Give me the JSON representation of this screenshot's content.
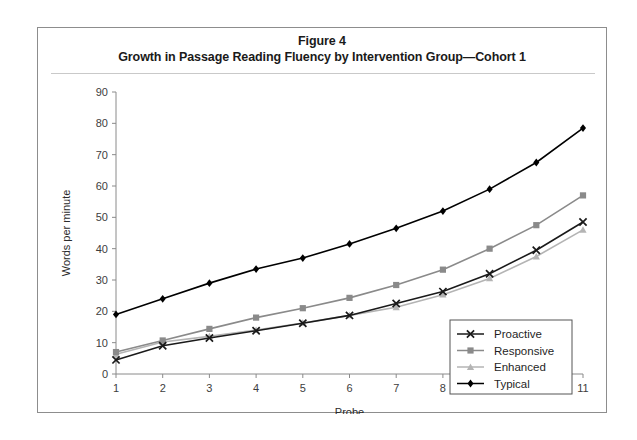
{
  "figure": {
    "number_label": "Figure 4",
    "title": "Growth in Passage Reading Fluency by Intervention Group—Cohort 1"
  },
  "chart_data": {
    "type": "line",
    "title": "Growth in Passage Reading Fluency by Intervention Group—Cohort 1",
    "xlabel": "Probe",
    "ylabel": "Words per minute",
    "x": [
      1,
      2,
      3,
      4,
      5,
      6,
      7,
      8,
      9,
      10,
      11
    ],
    "categories": [
      "1",
      "2",
      "3",
      "4",
      "5",
      "6",
      "7",
      "8",
      "9",
      "10",
      "11"
    ],
    "xlim": [
      1,
      11
    ],
    "ylim": [
      0,
      90
    ],
    "yticks": [
      0,
      10,
      20,
      30,
      40,
      50,
      60,
      70,
      80,
      90
    ],
    "ytick_labels": [
      "0",
      "10",
      "20",
      "30",
      "40",
      "50",
      "60",
      "70",
      "80",
      "90"
    ],
    "grid": false,
    "legend_position": "lower-right-inside",
    "series": [
      {
        "name": "Proactive",
        "marker": "x",
        "color": "#1a1a1a",
        "values": [
          4.5,
          9.0,
          11.5,
          13.8,
          16.2,
          18.7,
          22.5,
          26.3,
          32.0,
          39.5,
          48.5
        ]
      },
      {
        "name": "Responsive",
        "marker": "square",
        "color": "#8a8a8a",
        "values": [
          7.0,
          10.7,
          14.4,
          18.0,
          21.0,
          24.3,
          28.4,
          33.3,
          40.0,
          47.5,
          57.0
        ]
      },
      {
        "name": "Enhanced",
        "marker": "triangle",
        "color": "#b4b4b4",
        "values": [
          6.3,
          10.2,
          12.0,
          14.0,
          16.3,
          18.7,
          21.3,
          25.3,
          30.5,
          37.5,
          46.0
        ]
      },
      {
        "name": "Typical",
        "marker": "diamond",
        "color": "#000000",
        "values": [
          19.0,
          24.0,
          29.0,
          33.5,
          37.0,
          41.5,
          46.5,
          52.0,
          59.0,
          67.5,
          78.5
        ]
      }
    ]
  }
}
